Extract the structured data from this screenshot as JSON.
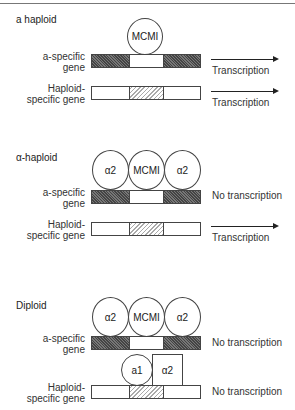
{
  "panels": [
    {
      "title": "a haploid",
      "a_specific_gene": {
        "label_line1": "a-specific",
        "label_line2": "gene",
        "bound_proteins": [
          "MCMI"
        ],
        "status": "Transcription",
        "arrow": true
      },
      "haploid_specific_gene": {
        "label_line1": "Haploid-",
        "label_line2": "specific gene",
        "bound_proteins": [],
        "status": "Transcription",
        "arrow": true
      }
    },
    {
      "title": "α-haploid",
      "a_specific_gene": {
        "label_line1": "a-specific",
        "label_line2": "gene",
        "bound_proteins": [
          "α2",
          "MCMI",
          "α2"
        ],
        "status": "No transcription",
        "arrow": false
      },
      "haploid_specific_gene": {
        "label_line1": "Haploid-",
        "label_line2": "specific gene",
        "bound_proteins": [],
        "status": "Transcription",
        "arrow": true
      }
    },
    {
      "title": "Diploid",
      "a_specific_gene": {
        "label_line1": "a-specific",
        "label_line2": "gene",
        "bound_proteins": [
          "α2",
          "MCMI",
          "α2"
        ],
        "status": "No transcription",
        "arrow": false
      },
      "haploid_specific_gene": {
        "label_line1": "Haploid-",
        "label_line2": "specific gene",
        "bound_proteins": [
          "a1",
          "α2"
        ],
        "status": "No transcription",
        "arrow": false
      }
    }
  ]
}
